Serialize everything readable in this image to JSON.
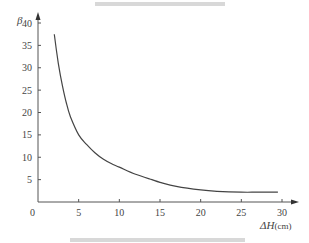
{
  "chart_data": {
    "type": "line",
    "title": "",
    "xlabel": "ΔH(cm)",
    "ylabel": "β",
    "xlim": [
      0,
      30
    ],
    "ylim": [
      0,
      40
    ],
    "x_ticks": [
      0,
      5,
      10,
      15,
      20,
      25,
      30
    ],
    "y_ticks": [
      5,
      10,
      15,
      20,
      25,
      30,
      35,
      40
    ],
    "grid": false,
    "legend": null,
    "series": [
      {
        "name": "β",
        "x": [
          2,
          2.5,
          3,
          3.5,
          4,
          5,
          6,
          7,
          8,
          9,
          10,
          12,
          14,
          15,
          17,
          20,
          22,
          25,
          27,
          29.5
        ],
        "y": [
          37.5,
          31,
          26,
          22,
          19,
          15,
          12.8,
          11,
          9.6,
          8.6,
          7.8,
          6.2,
          5,
          4.4,
          3.5,
          2.7,
          2.4,
          2.2,
          2.2,
          2.2
        ]
      }
    ]
  },
  "axes": {
    "y_label": "β",
    "x_label": "ΔH",
    "x_unit": "(cm)",
    "origin_label": "0",
    "x_tick_labels": [
      "5",
      "10",
      "15",
      "20",
      "25",
      "30"
    ],
    "y_tick_labels": [
      "5",
      "10",
      "15",
      "20",
      "25",
      "30",
      "35",
      "40"
    ]
  }
}
